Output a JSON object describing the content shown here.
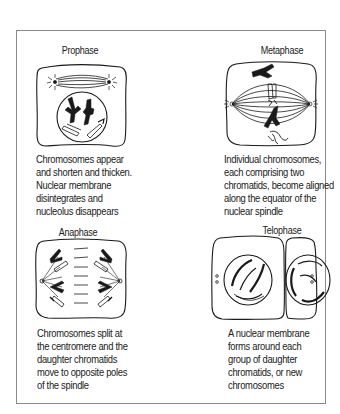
{
  "figure": {
    "panels": [
      {
        "id": "prophase",
        "title": "Prophase",
        "caption": "Chromosomes appear\nand shorten and thicken.\nNuclear membrane\ndisintegrates and\nnucleolus disappears"
      },
      {
        "id": "metaphase",
        "title": "Metaphase",
        "caption": "Individual chromosomes,\neach comprising two\nchromatids, become aligned\nalong the equator of the\nnuclear spindle"
      },
      {
        "id": "anaphase",
        "title": "Anaphase",
        "caption": "Chromosomes split at\nthe centromere and the\ndaughter chromatids\nmove to opposite poles\nof the spindle"
      },
      {
        "id": "telophase",
        "title": "Telophase",
        "caption": "A nuclear membrane\nforms around each\ngroup of daughter\nchromatids, or new\nchromosomes"
      }
    ],
    "colors": {
      "ink": "#1a1a1a",
      "frame": "#8a8a8a",
      "background": "#ffffff"
    }
  }
}
